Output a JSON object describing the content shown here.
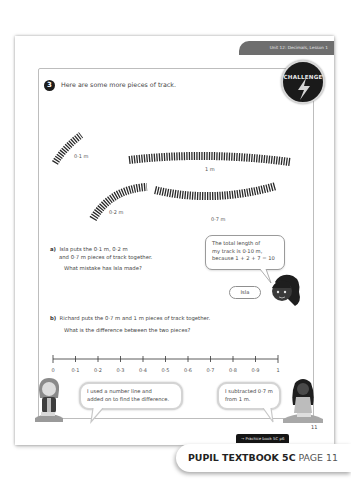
{
  "header": {
    "unit_lesson": "Unit 12: Decimals, Lesson 1"
  },
  "question": {
    "number": "3",
    "prompt": "Here are some more pieces of track.",
    "badge": "CHALLENGE",
    "tracks": [
      {
        "label": "0·1 m"
      },
      {
        "label": "1 m"
      },
      {
        "label": "0·2 m"
      },
      {
        "label": "0·7 m"
      }
    ]
  },
  "part_a": {
    "marker": "a)",
    "line1": "Isla puts the 0·1 m, 0·2 m",
    "line2": "and 0·7 m pieces of track together.",
    "question": "What mistake has Isla made?",
    "bubble": {
      "line1": "The total length of",
      "line2": "my track is 0·10 m,",
      "line3": "because 1 + 2 + 7 = 10"
    },
    "character_name": "Isla"
  },
  "part_b": {
    "marker": "b)",
    "line1": "Richard puts the 0·7 m and 1 m pieces of track together.",
    "question": "What is the difference between the two pieces?",
    "number_line": [
      "0",
      "0·1",
      "0·2",
      "0·3",
      "0·4",
      "0·5",
      "0·6",
      "0·7",
      "0·8",
      "0·9",
      "1"
    ],
    "bubble_left": {
      "line1": "I used a number line and",
      "line2": "added on to find the difference."
    },
    "bubble_right": {
      "line1": "I subtracted 0·7 m",
      "line2": "from 1 m."
    }
  },
  "footer": {
    "page_number": "11",
    "practice_link": "→ Practice book 5C p6",
    "textbook_title": "PUPIL TEXTBOOK 5C",
    "textbook_page": "PAGE 11"
  }
}
